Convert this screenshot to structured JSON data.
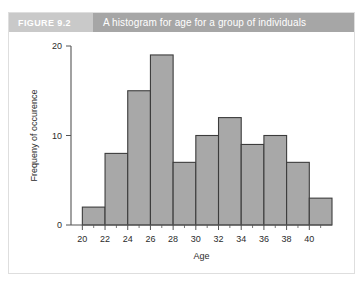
{
  "figure": {
    "label": "FIGURE 9.2",
    "title": "A histogram for age for a group of individuals"
  },
  "colors": {
    "label_bg": "#c9c9c9",
    "title_bg": "#a6a6a6",
    "header_text": "#ffffff",
    "bar_fill": "#a8a8a8",
    "bar_stroke": "#3c3c3c",
    "axis": "#555555",
    "card_bg": "#ffffff",
    "card_border": "#dedede"
  },
  "chart_data": {
    "type": "bar",
    "title": "A histogram for age for a group of individuals",
    "xlabel": "Age",
    "ylabel": "Frequeny of occurence",
    "xlim": [
      19,
      42
    ],
    "ylim": [
      0,
      20
    ],
    "grid": false,
    "legend": null,
    "bin_width": 2,
    "bin_starts": [
      20,
      22,
      24,
      26,
      28,
      30,
      32,
      34,
      36,
      38,
      40
    ],
    "bin_edges": [
      20,
      22,
      24,
      26,
      28,
      30,
      32,
      34,
      36,
      38,
      40,
      42
    ],
    "categories": [
      "20-22",
      "22-24",
      "24-26",
      "26-28",
      "28-30",
      "30-32",
      "32-34",
      "34-36",
      "36-38",
      "38-40",
      "40-42"
    ],
    "values": [
      2,
      8,
      15,
      19,
      7,
      10,
      12,
      9,
      10,
      7,
      3
    ],
    "xticks": [
      20,
      22,
      24,
      26,
      28,
      30,
      32,
      34,
      36,
      38,
      40
    ],
    "xtick_labels": [
      "20",
      "22",
      "24",
      "26",
      "28",
      "30",
      "32",
      "34",
      "36",
      "38",
      "40"
    ],
    "x_minor_ticks": [
      21,
      23,
      25,
      27,
      29,
      31,
      33,
      35,
      37,
      39,
      41
    ],
    "yticks": [
      0,
      10,
      20
    ],
    "ytick_labels": [
      "0",
      "10",
      "20"
    ]
  }
}
